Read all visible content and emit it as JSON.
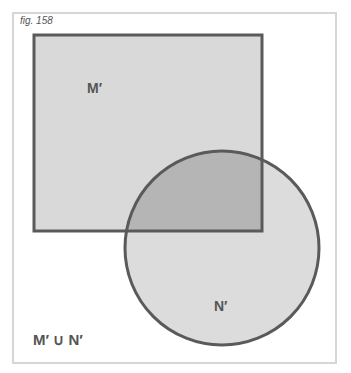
{
  "figure": {
    "label": "fig. 158",
    "caption": "M′ ∪ N′"
  },
  "diagram": {
    "type": "venn",
    "sets": [
      {
        "name": "M′",
        "shape": "square"
      },
      {
        "name": "N′",
        "shape": "circle"
      }
    ],
    "operation": "union",
    "colors": {
      "fill": "#d9d9d9",
      "overlap": "#b5b5b5",
      "stroke": "#5a5a5a",
      "frame": "#d6d6d6"
    }
  }
}
